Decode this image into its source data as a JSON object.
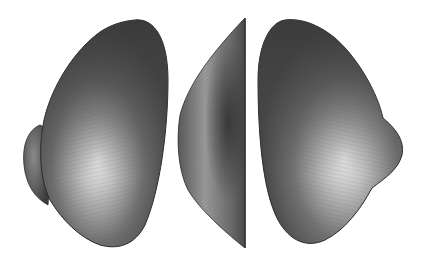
{
  "figure": {
    "views": [
      {
        "name": "left-view"
      },
      {
        "name": "side-view"
      },
      {
        "name": "right-view"
      }
    ],
    "colors": {
      "background": "#ffffff",
      "dark": "#3a3a3a",
      "mid": "#6e6e6e",
      "highlight": "#e6e6e6",
      "outline": "#2a2a2a"
    }
  }
}
